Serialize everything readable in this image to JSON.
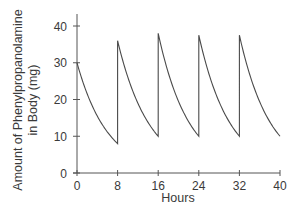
{
  "chart_data": {
    "type": "line",
    "title": "",
    "xlabel": "Hours",
    "ylabel": [
      "Amount of Phenylpropanolamine",
      "in Body (mg)"
    ],
    "xlim": [
      0,
      40
    ],
    "ylim": [
      0,
      40
    ],
    "x_ticks": [
      0,
      8,
      16,
      24,
      32,
      40
    ],
    "y_ticks": [
      0,
      10,
      20,
      30,
      40
    ],
    "grid": false,
    "legend": null,
    "series": [
      {
        "name": "Amount in body",
        "color": "#4a4a4a",
        "segments": [
          {
            "start": [
              0,
              30
            ],
            "end": [
              8,
              8
            ]
          },
          {
            "start": [
              8,
              36
            ],
            "end": [
              16,
              10
            ]
          },
          {
            "start": [
              16,
              38
            ],
            "end": [
              24,
              10
            ]
          },
          {
            "start": [
              24,
              37.5
            ],
            "end": [
              32,
              10
            ]
          },
          {
            "start": [
              32,
              37.5
            ],
            "end": [
              40,
              10
            ]
          }
        ],
        "points": [
          [
            0,
            30
          ],
          [
            8,
            8
          ],
          [
            8,
            36
          ],
          [
            16,
            10
          ],
          [
            16,
            38
          ],
          [
            24,
            10
          ],
          [
            24,
            37.5
          ],
          [
            32,
            10
          ],
          [
            32,
            37.5
          ],
          [
            40,
            10
          ]
        ]
      }
    ]
  }
}
